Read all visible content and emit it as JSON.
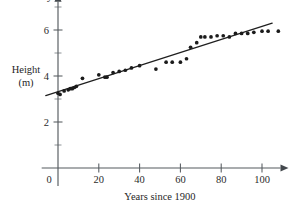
{
  "chart_data": {
    "type": "scatter",
    "title": "",
    "xlabel": "Years since 1900",
    "ylabel": "Height (m)",
    "ylabel_line1": "Height",
    "ylabel_line2": "(m)",
    "x_axis_symbol": "x",
    "y_axis_symbol": "y",
    "xlim": [
      -8,
      112
    ],
    "ylim": [
      0,
      7.4
    ],
    "grid": false,
    "legend": "none",
    "xticks": [
      0,
      20,
      40,
      60,
      80,
      100
    ],
    "xtick_labels": [
      "0",
      "20",
      "40",
      "60",
      "80",
      "100"
    ],
    "yticks": [
      2,
      4,
      6
    ],
    "ytick_labels": [
      "2",
      "4",
      "6"
    ],
    "y_minor_ticks": [
      1,
      3,
      5,
      7
    ],
    "point_color": "#1b1b1b",
    "line_color": "#1f1f1f",
    "axis_color": "#555a5f",
    "background_color": "#ffffff",
    "series": [
      {
        "name": "Observed height",
        "x": [
          0,
          1,
          3,
          5,
          6,
          7,
          8,
          9,
          12,
          20,
          23,
          24,
          27,
          30,
          33,
          36,
          40,
          48,
          53,
          56,
          60,
          63,
          65,
          68,
          70,
          72,
          75,
          78,
          81,
          84,
          87,
          90,
          93,
          96,
          100,
          103,
          108
        ],
        "y": [
          3.25,
          3.2,
          3.35,
          3.4,
          3.45,
          3.45,
          3.5,
          3.55,
          3.9,
          4.05,
          3.95,
          3.95,
          4.15,
          4.2,
          4.25,
          4.35,
          4.45,
          4.3,
          4.6,
          4.6,
          4.6,
          4.75,
          5.25,
          5.45,
          5.7,
          5.7,
          5.7,
          5.75,
          5.75,
          5.7,
          5.85,
          5.85,
          5.85,
          5.9,
          5.95,
          5.95,
          5.95
        ]
      }
    ],
    "fit_line": {
      "name": "Line of best fit",
      "x_start": -6,
      "y_start": 3.15,
      "x_end": 105,
      "y_end": 6.3
    }
  }
}
